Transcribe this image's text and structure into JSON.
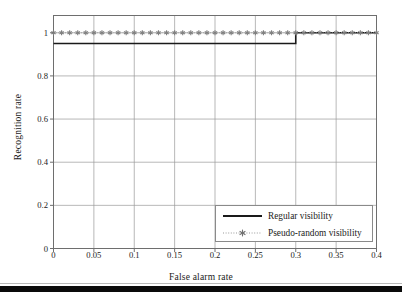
{
  "chart_data": {
    "type": "line",
    "title": "",
    "xlabel": "False alarm rate",
    "ylabel": "Recognition rate",
    "xlim": [
      0,
      0.4
    ],
    "ylim": [
      0,
      1.08
    ],
    "grid": true,
    "legend_position": "lower right",
    "xticks": [
      0,
      0.05,
      0.1,
      0.15,
      0.2,
      0.25,
      0.3,
      0.35,
      0.4
    ],
    "xtick_labels": [
      "0",
      "0.05",
      "0.1",
      "0.15",
      "0.2",
      "0.25",
      "0.3",
      "0.35",
      "0.4"
    ],
    "yticks": [
      0,
      0.2,
      0.4,
      0.6,
      0.8,
      1
    ],
    "ytick_labels": [
      "0",
      "0.2",
      "0.4",
      "0.6",
      "0.8",
      "1"
    ],
    "series": [
      {
        "name": "Regular visibility",
        "style": "solid",
        "color": "#1a1a1a",
        "marker": "none",
        "x": [
          0,
          0.3,
          0.3,
          0.4
        ],
        "values": [
          0.95,
          0.95,
          1.0,
          1.0
        ]
      },
      {
        "name": "Pseudo-random visibility",
        "style": "dotted",
        "color": "#808080",
        "marker": "asterisk",
        "x": [
          0,
          0.01,
          0.02,
          0.03,
          0.04,
          0.05,
          0.06,
          0.07,
          0.08,
          0.09,
          0.1,
          0.11,
          0.12,
          0.13,
          0.14,
          0.15,
          0.16,
          0.17,
          0.18,
          0.19,
          0.2,
          0.21,
          0.22,
          0.23,
          0.24,
          0.25,
          0.26,
          0.27,
          0.28,
          0.29,
          0.3,
          0.31,
          0.32,
          0.33,
          0.34,
          0.35,
          0.36,
          0.37,
          0.38,
          0.39,
          0.4
        ],
        "values": [
          1,
          1,
          1,
          1,
          1,
          1,
          1,
          1,
          1,
          1,
          1,
          1,
          1,
          1,
          1,
          1,
          1,
          1,
          1,
          1,
          1,
          1,
          1,
          1,
          1,
          1,
          1,
          1,
          1,
          1,
          1,
          1,
          1,
          1,
          1,
          1,
          1,
          1,
          1,
          1,
          1
        ]
      }
    ]
  },
  "legend": {
    "entries": [
      {
        "label": "Regular visibility"
      },
      {
        "label": "Pseudo-random visibility"
      }
    ]
  },
  "colors": {
    "axis": "#6e6e6e",
    "grid": "#9a9a9a",
    "solid_series": "#1a1a1a",
    "dotted_series": "#808080",
    "text": "#1a1a1a",
    "page_edge": "#0a0a0a"
  }
}
